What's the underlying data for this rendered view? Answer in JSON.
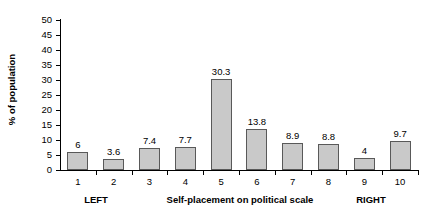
{
  "chart_data": {
    "type": "bar",
    "title": "",
    "categories": [
      "1",
      "2",
      "3",
      "4",
      "5",
      "6",
      "7",
      "8",
      "9",
      "10"
    ],
    "values": [
      6,
      3.6,
      7.4,
      7.7,
      30.3,
      13.8,
      8.9,
      8.8,
      4,
      9.7
    ],
    "value_labels": [
      "6",
      "3.6",
      "7.4",
      "7.7",
      "30.3",
      "13.8",
      "8.9",
      "8.8",
      "4",
      "9.7"
    ],
    "xlabel": "Self-placement on political scale",
    "ylabel": "% of population",
    "ylim": [
      0,
      50
    ],
    "ytick_step": 5,
    "ytick_labels": [
      "50",
      "45",
      "40",
      "35",
      "30",
      "25",
      "20",
      "15",
      "10",
      "5",
      "0"
    ],
    "grid": false,
    "legend": null,
    "bar_color": "#c9c9c9",
    "bar_border_color": "#595959",
    "axis_color": "#000000",
    "annotations": {
      "left_pole": "LEFT",
      "right_pole": "RIGHT"
    }
  },
  "axis_titles": {
    "y": "% of population",
    "x_center": "Self-placement on political scale",
    "x_left": "LEFT",
    "x_right": "RIGHT"
  }
}
